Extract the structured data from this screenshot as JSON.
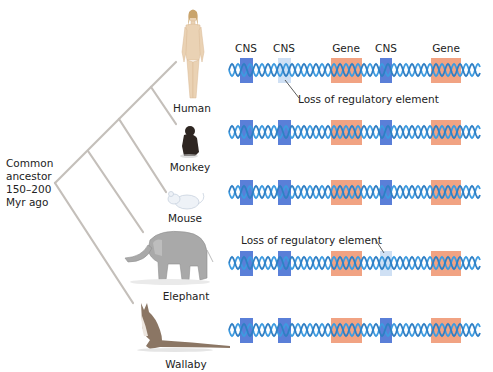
{
  "figure": {
    "column_headers": [
      {
        "label": "CNS",
        "x": 246
      },
      {
        "label": "CNS",
        "x": 284
      },
      {
        "label": "Gene",
        "x": 346
      },
      {
        "label": "CNS",
        "x": 386
      },
      {
        "label": "Gene",
        "x": 446
      }
    ],
    "ancestor": {
      "lines": [
        "Common",
        "ancestor",
        "150–200",
        "Myr ago"
      ]
    },
    "species": [
      {
        "name": "Human",
        "icon": "human-figure-icon",
        "label_x": 192,
        "label_y": 102,
        "row_y": 70,
        "lost_element_index": 1
      },
      {
        "name": "Monkey",
        "icon": "monkey-icon",
        "label_x": 190,
        "label_y": 161,
        "row_y": 132,
        "lost_element_index": null
      },
      {
        "name": "Mouse",
        "icon": "mouse-icon",
        "label_x": 185,
        "label_y": 212,
        "row_y": 192,
        "lost_element_index": null
      },
      {
        "name": "Elephant",
        "icon": "elephant-icon",
        "label_x": 186,
        "label_y": 290,
        "row_y": 263,
        "lost_element_index": 3
      },
      {
        "name": "Wallaby",
        "icon": "wallaby-icon",
        "label_x": 186,
        "label_y": 358,
        "row_y": 330,
        "lost_element_index": null
      }
    ],
    "elements": [
      {
        "type": "CNS",
        "x": 240,
        "w": 13
      },
      {
        "type": "CNS",
        "x": 278,
        "w": 13
      },
      {
        "type": "Gene",
        "x": 331,
        "w": 31
      },
      {
        "type": "CNS",
        "x": 380,
        "w": 12
      },
      {
        "type": "Gene",
        "x": 431,
        "w": 30
      }
    ],
    "annotations": [
      {
        "text": "Loss of regulatory element",
        "x": 298,
        "y": 94,
        "row": "Human"
      },
      {
        "text": "Loss of regulatory element",
        "x": 241,
        "y": 235,
        "row": "Elephant"
      }
    ],
    "colors": {
      "helix": "#3d9be0",
      "helix_dark": "#2f7fc4",
      "cns": "#5a7fd8",
      "cns_lost": "#cfe0f4",
      "gene": "#f1a383",
      "tree": "#c4bfba",
      "text": "#222222"
    }
  }
}
